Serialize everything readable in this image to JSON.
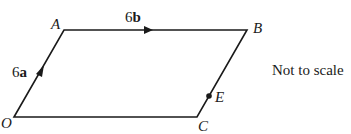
{
  "diagram": {
    "type": "parallelogram",
    "vertices": {
      "O": {
        "label": "O",
        "x": 14,
        "y": 117
      },
      "A": {
        "label": "A",
        "x": 64,
        "y": 30
      },
      "B": {
        "label": "B",
        "x": 247,
        "y": 30
      },
      "C": {
        "label": "C",
        "x": 197,
        "y": 117
      }
    },
    "point_E": {
      "label": "E",
      "x": 209,
      "y": 96,
      "on_edge": "CB"
    },
    "vectors": [
      {
        "edge": "OA",
        "coef": "6",
        "symbol": "a"
      },
      {
        "edge": "AB",
        "coef": "6",
        "symbol": "b"
      }
    ],
    "note": "Not to scale",
    "colors": {
      "stroke": "#1a1a1a",
      "background": "#ffffff"
    }
  }
}
